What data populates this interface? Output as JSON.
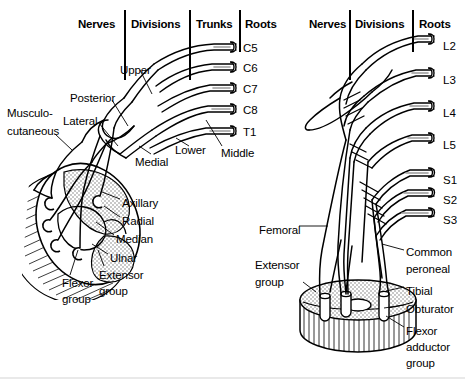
{
  "figure": {
    "background": "#ffffff",
    "ink": "#000000",
    "stipple": "#8a8a8a"
  },
  "left_panel": {
    "name": "brachial-plexus",
    "headers": [
      {
        "label": "Nerves",
        "x": 78,
        "y": 18
      },
      {
        "label": "Divisions",
        "x": 131,
        "y": 18
      },
      {
        "label": "Trunks",
        "x": 196,
        "y": 18
      },
      {
        "label": "Roots",
        "x": 245,
        "y": 18
      }
    ],
    "dividers": [
      {
        "x": 124,
        "y": 10,
        "h": 70
      },
      {
        "x": 189,
        "y": 10,
        "h": 70
      },
      {
        "x": 239,
        "y": 10,
        "h": 42
      }
    ],
    "roots": [
      {
        "label": "C5",
        "x": 243,
        "y": 42
      },
      {
        "label": "C6",
        "x": 243,
        "y": 62
      },
      {
        "label": "C7",
        "x": 243,
        "y": 83
      },
      {
        "label": "C8",
        "x": 243,
        "y": 104
      },
      {
        "label": "T1",
        "x": 243,
        "y": 126
      }
    ],
    "trunks": [
      {
        "label": "Upper",
        "x": 120,
        "y": 64
      },
      {
        "label": "Middle",
        "x": 221,
        "y": 147
      },
      {
        "label": "Lower",
        "x": 175,
        "y": 144
      }
    ],
    "divisions": [
      {
        "label": "Posterior",
        "x": 70,
        "y": 92
      },
      {
        "label": "Lateral",
        "x": 63,
        "y": 115
      },
      {
        "label": "Medial",
        "x": 135,
        "y": 156
      }
    ],
    "nerves": [
      {
        "label": "Musculo-",
        "x": 7,
        "y": 107
      },
      {
        "label": "cutaneous",
        "x": 7,
        "y": 125
      },
      {
        "label": "Axillary",
        "x": 122,
        "y": 197
      },
      {
        "label": "Radial",
        "x": 122,
        "y": 215
      },
      {
        "label": "Median",
        "x": 116,
        "y": 233
      },
      {
        "label": "Ulnar",
        "x": 110,
        "y": 252
      }
    ],
    "muscle_groups": [
      {
        "label": "Extensor",
        "x": 99,
        "y": 269
      },
      {
        "label": "group",
        "x": 99,
        "y": 285
      },
      {
        "label": "Flexor",
        "x": 62,
        "y": 277
      },
      {
        "label": "group",
        "x": 62,
        "y": 293
      }
    ]
  },
  "right_panel": {
    "name": "lumbosacral-plexus",
    "headers": [
      {
        "label": "Nerves",
        "x": 309,
        "y": 18
      },
      {
        "label": "Divisions",
        "x": 355,
        "y": 18
      },
      {
        "label": "Roots",
        "x": 419,
        "y": 18
      }
    ],
    "dividers": [
      {
        "x": 349,
        "y": 10,
        "h": 70
      },
      {
        "x": 412,
        "y": 10,
        "h": 42
      }
    ],
    "roots": [
      {
        "label": "L2",
        "x": 443,
        "y": 40
      },
      {
        "label": "L3",
        "x": 443,
        "y": 74
      },
      {
        "label": "L4",
        "x": 443,
        "y": 107
      },
      {
        "label": "L5",
        "x": 443,
        "y": 139
      },
      {
        "label": "S1",
        "x": 443,
        "y": 174
      },
      {
        "label": "S2",
        "x": 443,
        "y": 194
      },
      {
        "label": "S3",
        "x": 443,
        "y": 214
      }
    ],
    "nerves": [
      {
        "label": "Femoral",
        "x": 259,
        "y": 224
      },
      {
        "label": "Common",
        "x": 406,
        "y": 246
      },
      {
        "label": "peroneal",
        "x": 406,
        "y": 263
      },
      {
        "label": "Tibial",
        "x": 406,
        "y": 285
      },
      {
        "label": "Obturator",
        "x": 406,
        "y": 303
      }
    ],
    "muscle_groups": [
      {
        "label": "Extensor",
        "x": 255,
        "y": 259
      },
      {
        "label": "group",
        "x": 255,
        "y": 276
      },
      {
        "label": "Flexor",
        "x": 406,
        "y": 325
      },
      {
        "label": "adductor",
        "x": 406,
        "y": 341
      },
      {
        "label": "group",
        "x": 406,
        "y": 357
      }
    ]
  }
}
